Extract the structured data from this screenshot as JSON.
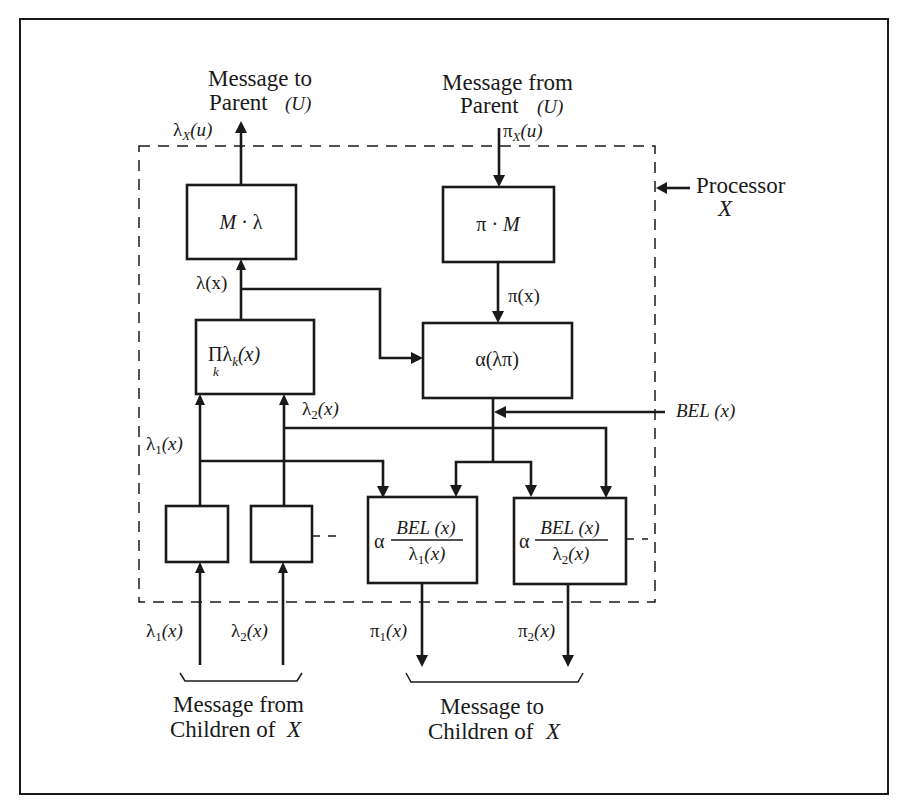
{
  "diagram": {
    "processor_label": {
      "line1": "Processor",
      "line2": "X"
    },
    "top_left": {
      "line1": "Message to",
      "line2": "Parent",
      "var": "(U)",
      "signal": "λ",
      "signal_sub": "X",
      "signal_arg": "(u)"
    },
    "top_right": {
      "line1": "Message from",
      "line2": "Parent",
      "var": "(U)",
      "signal": "π",
      "signal_sub": "X",
      "signal_arg": "(u)"
    },
    "boxes": {
      "m_lambda": {
        "left": "M",
        "dot": " · ",
        "right": "λ"
      },
      "pi_m": {
        "left": "π",
        "dot": " · ",
        "right": "M"
      },
      "product": {
        "op": "Π",
        "lam": "λ",
        "sub": "k",
        "arg": "(x)",
        "under": "k"
      },
      "alpha": {
        "text": "α(λπ)"
      },
      "child1_out": {
        "alpha": "α",
        "num": "BEL (x)",
        "den_sym": "λ",
        "den_sub": "1",
        "den_arg": "(x)"
      },
      "child2_out": {
        "alpha": "α",
        "num": "BEL (x)",
        "den_sym": "λ",
        "den_sub": "2",
        "den_arg": "(x)"
      }
    },
    "signals": {
      "lambda_x": "λ(x)",
      "pi_x": "π(x)",
      "bel_x": "BEL (x)",
      "lambda1": {
        "sym": "λ",
        "sub": "1",
        "arg": "(x)"
      },
      "lambda2": {
        "sym": "λ",
        "sub": "2",
        "arg": "(x)"
      },
      "pi1": {
        "sym": "π",
        "sub": "1",
        "arg": "(x)"
      },
      "pi2": {
        "sym": "π",
        "sub": "2",
        "arg": "(x)"
      }
    },
    "bottom_left": {
      "line1": "Message from",
      "line2": "Children of",
      "var": "X"
    },
    "bottom_right": {
      "line1": "Message to",
      "line2": "Children of",
      "var": "X"
    }
  }
}
